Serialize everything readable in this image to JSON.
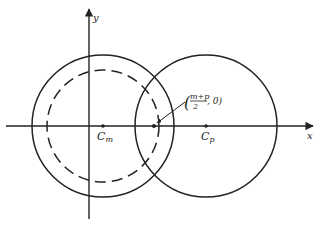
{
  "figure": {
    "axes": {
      "x_label": "x",
      "y_label": "y",
      "origin": [
        89,
        126
      ]
    },
    "circles": [
      {
        "name": "circle-m",
        "center": [
          103,
          126
        ],
        "radius": 71,
        "style": "solid"
      },
      {
        "name": "circle-m-inner",
        "center": [
          103,
          126
        ],
        "radius": 57,
        "style": "dashed"
      },
      {
        "name": "circle-p",
        "center": [
          206,
          126
        ],
        "radius": 71,
        "style": "solid"
      }
    ],
    "points": [
      {
        "name": "Cm",
        "label_main": "C",
        "label_sub": "m",
        "pos": [
          103,
          126
        ]
      },
      {
        "name": "Cp",
        "label_main": "C",
        "label_sub": "p",
        "pos": [
          206,
          126
        ]
      },
      {
        "name": "midpoint",
        "pos": [
          154,
          126
        ]
      }
    ],
    "annotation": {
      "numerator": "m+p",
      "denominator": "2",
      "suffix": ", 0)",
      "open_paren": "("
    },
    "colors": {
      "line": "#222222",
      "background": "#ffffff"
    }
  }
}
